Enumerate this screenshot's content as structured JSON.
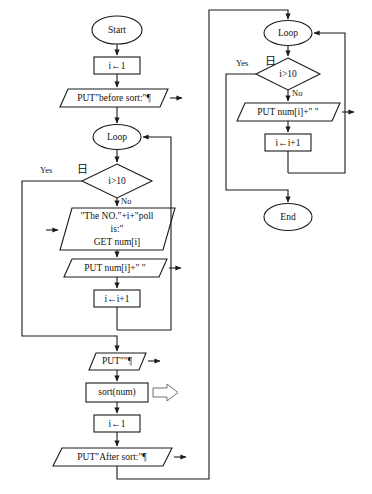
{
  "figure": {
    "type": "flowchart",
    "title": "",
    "caption": "",
    "colors": {
      "stroke": "#1a1a1a",
      "fill": "#ffffff",
      "background": "#ffffff",
      "faint_caption": "#d2d2d2"
    }
  },
  "left_column": {
    "start": "Start",
    "init_i": "i←1",
    "put_before": "PUT\"before sort:\"¶",
    "loop": "Loop",
    "decision": "i>10",
    "decision_yes": "Yes",
    "decision_no": "No",
    "input_prompt_line1": "\"The NO.\"+i+\"poll",
    "input_prompt_line2": "is:\"",
    "input_prompt_line3": "GET num[i]",
    "put_num": "PUT num[i]+\" \"",
    "increment": "i←i+1",
    "put_blank": "PUT\"\"¶",
    "sort": "sort(num)",
    "reset_i": "i←1",
    "put_after": "PUT\"After sort:\"¶"
  },
  "right_column": {
    "loop": "Loop",
    "decision": "i>10",
    "decision_yes": "Yes",
    "decision_no": "No",
    "put_num": "PUT num[i]+\" \"",
    "increment": "i←i+1",
    "end": "End"
  },
  "markers": {
    "collapse_glyph": "日"
  }
}
